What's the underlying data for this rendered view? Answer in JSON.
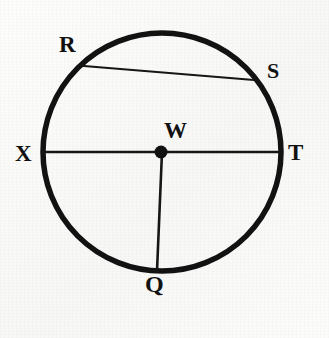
{
  "figure": {
    "background_color": "#fbfbfa",
    "ink_color": "#111111",
    "circle": {
      "name": "circle-W",
      "cx": 162,
      "cy": 152,
      "r": 119,
      "stroke_width": 5.5,
      "stroke_color": "#121212"
    },
    "center_dot": {
      "name": "center-point-W",
      "cx": 161,
      "cy": 152,
      "r": 6.5,
      "fill": "#111111"
    },
    "segments": [
      {
        "name": "diameter-XT",
        "kind": "diameter",
        "from": "X",
        "to": "T",
        "x1": 43,
        "y1": 152,
        "x2": 281,
        "y2": 152,
        "stroke_width": 2.4,
        "stroke_color": "#161616"
      },
      {
        "name": "radius-WQ",
        "kind": "radius",
        "from": "W",
        "to": "Q",
        "x1": 162,
        "y1": 152,
        "x2": 157,
        "y2": 271,
        "stroke_width": 2.6,
        "stroke_color": "#161616"
      },
      {
        "name": "chord-RS",
        "kind": "chord",
        "from": "R",
        "to": "S",
        "x1": 84,
        "y1": 66,
        "x2": 254,
        "y2": 80,
        "stroke_width": 2.2,
        "stroke_color": "#161616"
      }
    ],
    "labels": [
      {
        "id": "R",
        "text": "R",
        "x": 59,
        "y": 33,
        "font_size": 23
      },
      {
        "id": "S",
        "text": "S",
        "x": 267,
        "y": 60,
        "font_size": 22
      },
      {
        "id": "W",
        "text": "W",
        "x": 164,
        "y": 119,
        "font_size": 23
      },
      {
        "id": "X",
        "text": "X",
        "x": 15,
        "y": 142,
        "font_size": 23
      },
      {
        "id": "T",
        "text": "T",
        "x": 288,
        "y": 141,
        "font_size": 23
      },
      {
        "id": "Q",
        "text": "Q",
        "x": 145,
        "y": 272,
        "font_size": 24
      }
    ]
  }
}
